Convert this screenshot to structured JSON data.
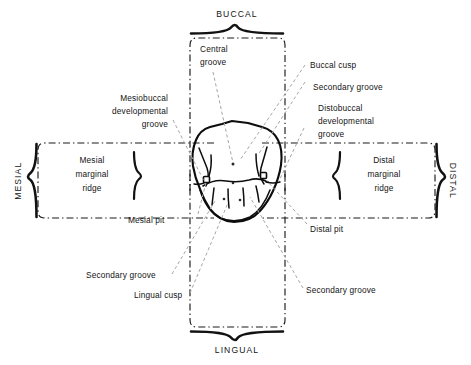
{
  "figure": {
    "kind": "dental-occlusal-anatomy-diagram"
  },
  "orientation_labels": {
    "buccal": "BUCCAL",
    "lingual": "LINGUAL",
    "mesial": "MESIAL",
    "distal": "DISTAL"
  },
  "ridge_labels": {
    "mesial_line1": "Mesial",
    "mesial_line2": "marginal",
    "mesial_line3": "ridge",
    "distal_line1": "Distal",
    "distal_line2": "marginal",
    "distal_line3": "ridge"
  },
  "callouts": {
    "central_groove_line1": "Central",
    "central_groove_line2": "groove",
    "mesiobuccal_line1": "Mesiobuccal",
    "mesiobuccal_line2": "developmental",
    "mesiobuccal_line3": "groove",
    "buccal_cusp": "Buccal cusp",
    "secondary_groove_top_right": "Secondary groove",
    "distobuccal_line1": "Distobuccal",
    "distobuccal_line2": "developmental",
    "distobuccal_line3": "groove",
    "mesial_pit": "Mesial pit",
    "distal_pit": "Distal pit",
    "secondary_groove_bottom_left": "Secondary groove",
    "lingual_cusp": "Lingual cusp",
    "secondary_groove_bottom_right": "Secondary groove"
  },
  "colors": {
    "ink": "#141414",
    "leader": "#9a9a9a",
    "background": "#ffffff"
  }
}
